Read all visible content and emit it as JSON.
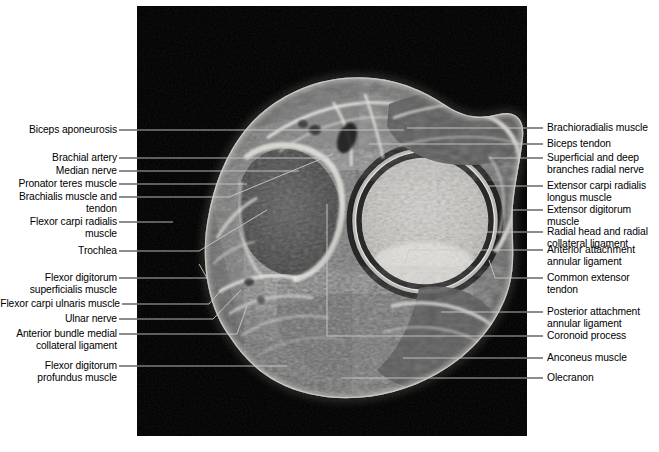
{
  "figure": {
    "modality": "MRI",
    "plane": "axial",
    "panel_background": "#000000",
    "page_background": "#ffffff",
    "leader_line_color": "#000000",
    "leader_line_color_on_image": "#c9c9c9"
  },
  "labels_left": [
    {
      "id": "biceps-aponeurosis",
      "text": "Biceps aponeurosis"
    },
    {
      "id": "brachial-artery",
      "text": "Brachial artery"
    },
    {
      "id": "median-nerve",
      "text": "Median nerve"
    },
    {
      "id": "pronator-teres-muscle",
      "text": "Pronator teres muscle"
    },
    {
      "id": "brachialis-muscle-and-tendon",
      "text": "Brachialis muscle and\ntendon"
    },
    {
      "id": "flexor-carpi-radialis-muscle",
      "text": "Flexor carpi radialis\nmuscle"
    },
    {
      "id": "trochlea",
      "text": "Trochlea"
    },
    {
      "id": "flexor-digitorum-superficialis-muscle",
      "text": "Flexor digitorum\nsuperficialis muscle"
    },
    {
      "id": "flexor-carpi-ulnaris-muscle",
      "text": "Flexor carpi ulnaris muscle"
    },
    {
      "id": "ulnar-nerve",
      "text": "Ulnar nerve"
    },
    {
      "id": "anterior-bundle-medial-collateral-ligament",
      "text": "Anterior bundle medial\ncollateral ligament"
    },
    {
      "id": "flexor-digitorum-profundus-muscle",
      "text": "Flexor digitorum\nprofundus muscle"
    }
  ],
  "labels_right": [
    {
      "id": "brachioradialis-muscle",
      "text": "Brachioradialis muscle"
    },
    {
      "id": "biceps-tendon",
      "text": "Biceps tendon"
    },
    {
      "id": "superficial-and-deep-branches-radial-nerve",
      "text": "Superficial and deep\nbranches radial nerve"
    },
    {
      "id": "extensor-carpi-radialis-longus-muscle",
      "text": "Extensor carpi radialis\nlongus muscle"
    },
    {
      "id": "extensor-digitorum-muscle",
      "text": "Extensor digitorum\nmuscle"
    },
    {
      "id": "radial-head-and-radial-collateral-ligament",
      "text": "Radial head and radial\ncollateral ligament"
    },
    {
      "id": "anterior-attachment-annular-ligament",
      "text": "Anterior attachment\nannular ligament"
    },
    {
      "id": "common-extensor-tendon",
      "text": "Common extensor\ntendon"
    },
    {
      "id": "posterior-attachment-annular-ligament",
      "text": "Posterior attachment\nannular ligament"
    },
    {
      "id": "coronoid-process",
      "text": "Coronoid process"
    },
    {
      "id": "anconeus-muscle",
      "text": "Anconeus muscle"
    },
    {
      "id": "olecranon",
      "text": "Olecranon"
    }
  ]
}
